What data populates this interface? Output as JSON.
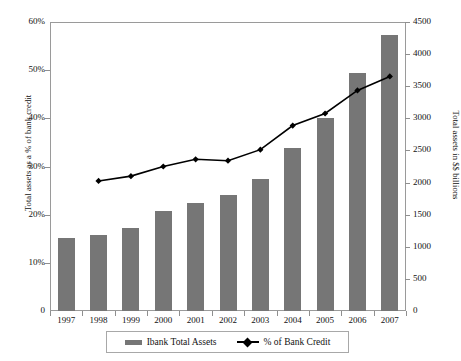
{
  "chart_data": {
    "type": "bar",
    "title": "",
    "xlabel": "",
    "categories": [
      "1997",
      "1998",
      "1999",
      "2000",
      "2001",
      "2002",
      "2003",
      "2004",
      "2005",
      "2006",
      "2007"
    ],
    "grid": false,
    "legend_position": "bottom",
    "series": [
      {
        "name": "Ibank Total Assets",
        "type": "bar",
        "axis": "right",
        "unit": "$ billions",
        "color": "#767676",
        "values": [
          1140,
          1180,
          1300,
          1550,
          1680,
          1810,
          2050,
          2540,
          3000,
          3700,
          4300
        ]
      },
      {
        "name": "% of Bank Credit",
        "type": "line",
        "axis": "left",
        "unit": "percent",
        "color": "#000000",
        "x": [
          "1998",
          "1999",
          "2000",
          "2001",
          "2002",
          "2003",
          "2004",
          "2005",
          "2006",
          "2007"
        ],
        "values": [
          27.0,
          28.0,
          30.0,
          31.5,
          31.2,
          33.5,
          38.5,
          41.0,
          45.8,
          48.7
        ]
      }
    ],
    "left_axis": {
      "label": "Total assets as a % of bank credit",
      "ylim": [
        0,
        60
      ],
      "ticks": [
        "0",
        "10%",
        "20%",
        "30%",
        "40%",
        "50%",
        "60%"
      ],
      "tick_values": [
        0,
        10,
        20,
        30,
        40,
        50,
        60
      ]
    },
    "right_axis": {
      "label": "Total assets in $$ billions",
      "ylim": [
        0,
        4500
      ],
      "ticks": [
        "0",
        "500",
        "1000",
        "1500",
        "2000",
        "2500",
        "3000",
        "3500",
        "4000",
        "4500"
      ],
      "tick_values": [
        0,
        500,
        1000,
        1500,
        2000,
        2500,
        3000,
        3500,
        4000,
        4500
      ]
    },
    "legend": {
      "items": [
        {
          "label": "Ibank Total Assets",
          "marker": "bar-swatch"
        },
        {
          "label": "% of Bank Credit",
          "marker": "line-diamond-marker"
        }
      ]
    }
  }
}
